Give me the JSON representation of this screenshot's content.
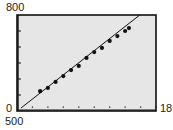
{
  "chart_data": {
    "type": "scatter",
    "title": "",
    "xlabel": "",
    "ylabel": "",
    "xlim": [
      0,
      18
    ],
    "ylim": [
      500,
      800
    ],
    "x_tick_interval": 2,
    "y_tick_interval": 50,
    "grid": false,
    "legend": null,
    "window_labels": {
      "ymax": "800",
      "ymin": "500",
      "xmin": "0",
      "xmax": "18"
    },
    "series": [
      {
        "name": "data",
        "style": "points",
        "x": [
          3,
          4,
          5,
          6,
          7,
          8,
          9,
          10,
          11,
          12,
          13,
          14,
          14.5
        ],
        "y": [
          562,
          572,
          591,
          609,
          628,
          641,
          666,
          684,
          697,
          719,
          734,
          750,
          759
        ]
      },
      {
        "name": "regression line",
        "style": "line",
        "x": [
          0.5,
          15.9
        ],
        "y": [
          509,
          800
        ]
      }
    ]
  },
  "colors": {
    "plot_bg": "#e6e6e6",
    "frame": "#111111",
    "points": "#111111",
    "line": "#111111"
  }
}
